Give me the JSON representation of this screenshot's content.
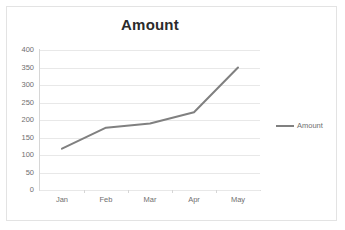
{
  "chart_data": {
    "type": "line",
    "title": "Amount",
    "xlabel": "",
    "ylabel": "",
    "categories": [
      "Jan",
      "Feb",
      "Mar",
      "Apr",
      "May"
    ],
    "series": [
      {
        "name": "Amount",
        "values": [
          118,
          178,
          190,
          222,
          350
        ],
        "color": "#808080"
      }
    ],
    "ylim": [
      0,
      400
    ],
    "yticks": [
      0,
      50,
      100,
      150,
      200,
      250,
      300,
      350,
      400
    ],
    "ytick_labels": [
      "0",
      "50",
      "100",
      "150",
      "200",
      "250",
      "300",
      "350",
      "400"
    ],
    "grid": true,
    "legend": {
      "position": "right",
      "entries": [
        {
          "label": "Amount",
          "color": "#808080"
        }
      ]
    },
    "colors": {
      "line": "#808080",
      "gridline": "#e8e8e8",
      "axis": "#d6d6d6",
      "tick_text": "#6f6f6f",
      "title_text": "#2b2b2b",
      "border": "#e3e3e3",
      "background": "#ffffff"
    }
  }
}
